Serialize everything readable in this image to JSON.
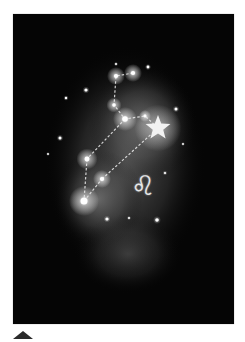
{
  "artwork": {
    "subject": "Leo constellation",
    "zodiac_glyph": "♌",
    "background_color": "#050505",
    "nebula_color": "#8a8a8a",
    "line_color": "#e6e6e6"
  },
  "constellation": {
    "stars": [
      {
        "x": 103,
        "y": 62,
        "r": 3
      },
      {
        "x": 120,
        "y": 59,
        "r": 3
      },
      {
        "x": 101,
        "y": 91,
        "r": 2.5
      },
      {
        "x": 112,
        "y": 105,
        "r": 4
      },
      {
        "x": 132,
        "y": 102,
        "r": 2
      },
      {
        "x": 74,
        "y": 145,
        "r": 3.5
      },
      {
        "x": 89,
        "y": 165,
        "r": 3
      },
      {
        "x": 71,
        "y": 187,
        "r": 5
      }
    ],
    "big_star": {
      "x": 145,
      "y": 114,
      "r": 13
    },
    "background_stars": [
      {
        "x": 73,
        "y": 76,
        "r": 1.6
      },
      {
        "x": 53,
        "y": 84,
        "r": 1.2
      },
      {
        "x": 47,
        "y": 124,
        "r": 1.5
      },
      {
        "x": 135,
        "y": 53,
        "r": 1.4
      },
      {
        "x": 163,
        "y": 95,
        "r": 1.5
      },
      {
        "x": 94,
        "y": 205,
        "r": 1.6
      },
      {
        "x": 144,
        "y": 206,
        "r": 1.8
      },
      {
        "x": 116,
        "y": 204,
        "r": 1
      },
      {
        "x": 152,
        "y": 159,
        "r": 1.1
      },
      {
        "x": 103,
        "y": 50,
        "r": 1
      },
      {
        "x": 35,
        "y": 140,
        "r": 0.9
      },
      {
        "x": 170,
        "y": 130,
        "r": 0.9
      }
    ]
  },
  "controls": {
    "scroll_up_label": "Scroll to top"
  }
}
